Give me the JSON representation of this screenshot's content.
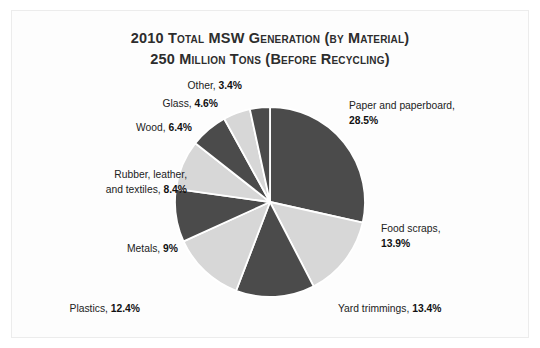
{
  "figure": {
    "title_line1": "2010 Total MSW Generation (by Material)",
    "title_line2": "250 Million Tons (Before Recycling)"
  },
  "colors": {
    "dark_slice": "#4b4b4b",
    "light_slice": "#d7d7d7",
    "slice_gap": "#ffffff",
    "text": "#222222",
    "frame": "#ececec",
    "background": "#fdfdfd"
  },
  "labels": {
    "paper": {
      "name": "Paper and paperboard,",
      "value": "28.5%"
    },
    "food": {
      "name": "Food scraps,",
      "value": "13.9%"
    },
    "yard": {
      "name": "Yard trimmings,",
      "value": "13.4%"
    },
    "plastics": {
      "name": "Plastics,",
      "value": "12.4%"
    },
    "metals": {
      "name": "Metals,",
      "value": "9%"
    },
    "rubber_line1": "Rubber, leather,",
    "rubber_line2": "and textiles,",
    "rubber_value": "8.4%",
    "wood": {
      "name": "Wood,",
      "value": "6.4%"
    },
    "glass": {
      "name": "Glass,",
      "value": "4.6%"
    },
    "other": {
      "name": "Other,",
      "value": "3.4%"
    }
  },
  "chart_data": {
    "type": "pie",
    "title": "2010 Total MSW Generation (by Material) 250 Million Tons (Before Recycling)",
    "total_label": "250 Million Tons",
    "unit": "percent",
    "start_angle_deg": -90,
    "direction": "clockwise",
    "legend": "none-labels-outside",
    "grid": false,
    "categories": [
      "Paper and paperboard",
      "Food scraps",
      "Yard trimmings",
      "Plastics",
      "Metals",
      "Rubber, leather, and textiles",
      "Wood",
      "Glass",
      "Other"
    ],
    "values": [
      28.5,
      13.9,
      13.4,
      12.4,
      9.0,
      8.4,
      6.4,
      4.6,
      3.4
    ],
    "slice_colors": [
      "#4b4b4b",
      "#d7d7d7",
      "#4b4b4b",
      "#d7d7d7",
      "#4b4b4b",
      "#d7d7d7",
      "#4b4b4b",
      "#d7d7d7",
      "#4b4b4b"
    ],
    "value_labels": [
      "28.5%",
      "13.9%",
      "13.4%",
      "12.4%",
      "9%",
      "8.4%",
      "6.4%",
      "4.6%",
      "3.4%"
    ]
  }
}
